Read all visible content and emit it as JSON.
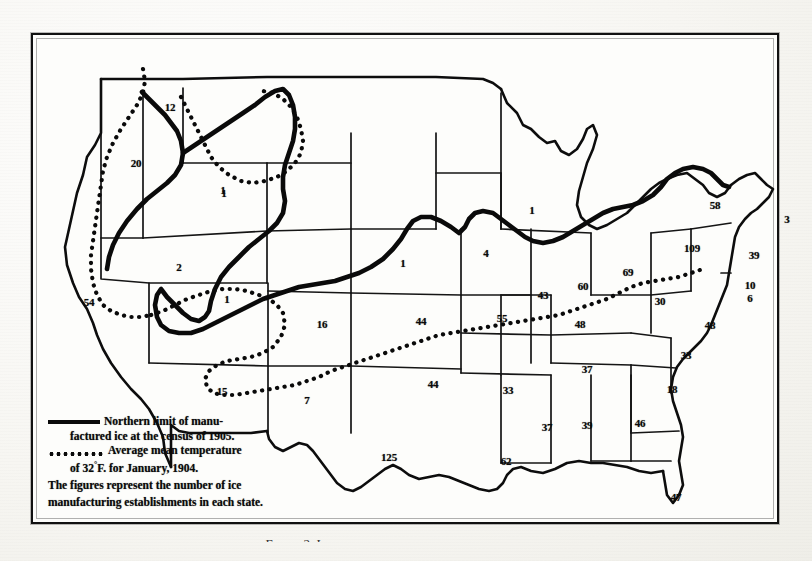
{
  "figure": {
    "caption": "Figure 2. Ice production and the line of manufacture",
    "frame_color": "#111111",
    "ink_color": "#0a0a0a",
    "paper_color": "#fbfbf9"
  },
  "legend": {
    "solid_symbol_name": "solid-line-swatch",
    "dotted_symbol_name": "dotted-line-swatch",
    "solid_line_1": "Northern limit of manu-",
    "solid_line_2": "factured ice at the census of 1905.",
    "dotted_line_1": "Average mean temperature",
    "dotted_line_2_pre": "of 32",
    "dotted_line_2_deg": "°",
    "dotted_line_2_post": "F. for January, 1904.",
    "note_line_1": "The figures represent the number of ice",
    "note_line_2": "manufacturing establishments in each state."
  },
  "chart_data": {
    "type": "map",
    "value_label": "ice manufacturing establishments",
    "legend_entries": [
      {
        "style": "solid",
        "label": "Northern limit of manufactured ice at the census of 1905."
      },
      {
        "style": "dotted",
        "label": "Average mean temperature of 32°F. for January, 1904."
      }
    ],
    "states": [
      {
        "code": "WA",
        "name": "Washington",
        "value": 12,
        "x": 139,
        "y": 74
      },
      {
        "code": "OR",
        "name": "Oregon",
        "value": 20,
        "x": 105,
        "y": 130
      },
      {
        "code": "CA",
        "name": "California",
        "value": 54,
        "x": 58,
        "y": 269
      },
      {
        "code": "NV",
        "name": "Nevada",
        "value": 2,
        "x": 148,
        "y": 234
      },
      {
        "code": "ID",
        "name": "Idaho",
        "value": 1,
        "x": 192,
        "y": 157
      },
      {
        "code": "UT",
        "name": "Utah",
        "value": 1,
        "x": 196,
        "y": 266
      },
      {
        "code": "AZ",
        "name": "Arizona",
        "value": 15,
        "x": 191,
        "y": 358
      },
      {
        "code": "NM",
        "name": "New Mexico",
        "value": 7,
        "x": 276,
        "y": 367
      },
      {
        "code": "CO",
        "name": "Colorado",
        "value": 16,
        "x": 291,
        "y": 291
      },
      {
        "code": "MT",
        "name": "Montana",
        "value": 1,
        "x": 193,
        "y": 160
      },
      {
        "code": "NE",
        "name": "Nebraska",
        "value": 1,
        "x": 372,
        "y": 230
      },
      {
        "code": "KS",
        "name": "Kansas",
        "value": 44,
        "x": 390,
        "y": 288
      },
      {
        "code": "OK",
        "name": "Oklahoma",
        "value": 44,
        "x": 402,
        "y": 351
      },
      {
        "code": "TX",
        "name": "Texas",
        "value": 125,
        "x": 358,
        "y": 424
      },
      {
        "code": "MO",
        "name": "Missouri",
        "value": 55,
        "x": 471,
        "y": 285
      },
      {
        "code": "IA",
        "name": "Iowa",
        "value": 4,
        "x": 455,
        "y": 220
      },
      {
        "code": "AR",
        "name": "Arkansas",
        "value": 33,
        "x": 477,
        "y": 357
      },
      {
        "code": "LA",
        "name": "Louisiana",
        "value": 62,
        "x": 475,
        "y": 428
      },
      {
        "code": "MS",
        "name": "Mississippi",
        "value": 37,
        "x": 516,
        "y": 394
      },
      {
        "code": "AL",
        "name": "Alabama",
        "value": 39,
        "x": 556,
        "y": 392
      },
      {
        "code": "GA",
        "name": "Georgia",
        "value": 46,
        "x": 609,
        "y": 390
      },
      {
        "code": "FL",
        "name": "Florida",
        "value": 47,
        "x": 645,
        "y": 464
      },
      {
        "code": "SC",
        "name": "South Carolina",
        "value": 18,
        "x": 641,
        "y": 356
      },
      {
        "code": "NC",
        "name": "North Carolina",
        "value": 33,
        "x": 655,
        "y": 322
      },
      {
        "code": "TN",
        "name": "Tennessee",
        "value": 37,
        "x": 556,
        "y": 336
      },
      {
        "code": "KY",
        "name": "Kentucky",
        "value": 48,
        "x": 549,
        "y": 291
      },
      {
        "code": "VA",
        "name": "Virginia",
        "value": 48,
        "x": 679,
        "y": 292
      },
      {
        "code": "WV",
        "name": "West Virginia",
        "value": 30,
        "x": 629,
        "y": 268
      },
      {
        "code": "IL",
        "name": "Illinois",
        "value": 43,
        "x": 512,
        "y": 262
      },
      {
        "code": "IN",
        "name": "Indiana",
        "value": 60,
        "x": 552,
        "y": 253
      },
      {
        "code": "OH",
        "name": "Ohio",
        "value": 69,
        "x": 597,
        "y": 239
      },
      {
        "code": "WI",
        "name": "Wisconsin",
        "value": 1,
        "x": 501,
        "y": 177
      },
      {
        "code": "NY",
        "name": "New York",
        "value": 58,
        "x": 684,
        "y": 172
      },
      {
        "code": "PA",
        "name": "Pennsylvania",
        "value": 109,
        "x": 661,
        "y": 215
      },
      {
        "code": "NJ",
        "name": "New Jersey",
        "value": 39,
        "x": 723,
        "y": 222
      },
      {
        "code": "DE",
        "name": "Delaware",
        "value": 10,
        "x": 719,
        "y": 252
      },
      {
        "code": "MD",
        "name": "Maryland",
        "value": 6,
        "x": 719,
        "y": 265
      },
      {
        "code": "MA",
        "name": "Massachusetts",
        "value": 3,
        "x": 756,
        "y": 186
      }
    ]
  }
}
